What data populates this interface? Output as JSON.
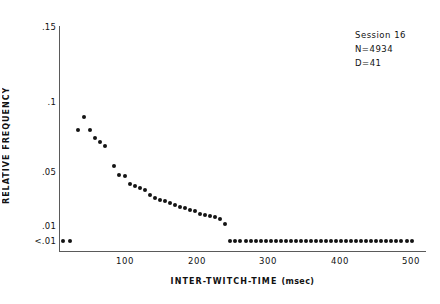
{
  "chart_data": {
    "type": "scatter",
    "title": "",
    "xlabel": "INTER-TWITCH-TIME",
    "xunit": "(msec)",
    "ylabel": "RELATIVE FREQUENCY",
    "xlim": [
      0,
      520
    ],
    "ylim": [
      0.005,
      0.15
    ],
    "yscale": "log-like-compressed",
    "grid": false,
    "legend": null,
    "xticks": [
      100,
      200,
      300,
      400,
      500
    ],
    "xticklabels": [
      "100",
      "200",
      "300",
      "400",
      "500"
    ],
    "yticks": [
      0.15,
      0.1,
      0.05,
      0.01,
      0.005
    ],
    "yticklabels": [
      ".15",
      ".1",
      ".05",
      ".01",
      "<.01"
    ],
    "floor_label": "<.01",
    "floor_value": 0.005,
    "annotations": [
      "Session 16",
      "N=4934",
      "D=41"
    ],
    "series": [
      {
        "name": "relative frequency",
        "marker": "filled-circle",
        "color": "#141414",
        "x": [
          12,
          22,
          33,
          42,
          50,
          57,
          64,
          71,
          84,
          91,
          99,
          106,
          113,
          120,
          127,
          134,
          141,
          148,
          155,
          162,
          169,
          176,
          183,
          190,
          197,
          204,
          211,
          218,
          225,
          232,
          239,
          246,
          253,
          260,
          268,
          275,
          282,
          289,
          296,
          303,
          310,
          317,
          324,
          331,
          338,
          345,
          352,
          360,
          367,
          374,
          381,
          388,
          395,
          402,
          409,
          416,
          423,
          430,
          437,
          444,
          451,
          458,
          465,
          472,
          479,
          486,
          493,
          500
        ],
        "y": [
          0.005,
          0.005,
          0.076,
          0.086,
          0.076,
          0.07,
          0.067,
          0.065,
          0.053,
          0.046,
          0.044,
          0.035,
          0.033,
          0.031,
          0.029,
          0.025,
          0.023,
          0.022,
          0.021,
          0.02,
          0.0185,
          0.0175,
          0.017,
          0.016,
          0.0155,
          0.0145,
          0.014,
          0.0135,
          0.013,
          0.0125,
          0.0105,
          0.005,
          0.005,
          0.005,
          0.005,
          0.005,
          0.005,
          0.005,
          0.005,
          0.005,
          0.005,
          0.005,
          0.005,
          0.005,
          0.005,
          0.005,
          0.005,
          0.005,
          0.005,
          0.005,
          0.005,
          0.005,
          0.005,
          0.005,
          0.005,
          0.005,
          0.005,
          0.005,
          0.005,
          0.005,
          0.005,
          0.005,
          0.005,
          0.005,
          0.005,
          0.005,
          0.005,
          0.005
        ]
      }
    ]
  },
  "axes_pixels": {
    "x0_px": 54.0,
    "px_per_msec": 0.715,
    "y_map": [
      {
        "value": 0.15,
        "px": 27
      },
      {
        "value": 0.1,
        "px": 102
      },
      {
        "value": 0.05,
        "px": 172
      },
      {
        "value": 0.01,
        "px": 226
      },
      {
        "value": 0.005,
        "px": 241
      }
    ]
  },
  "xtick_positions_px": [
    125,
    197,
    268,
    340,
    411
  ]
}
